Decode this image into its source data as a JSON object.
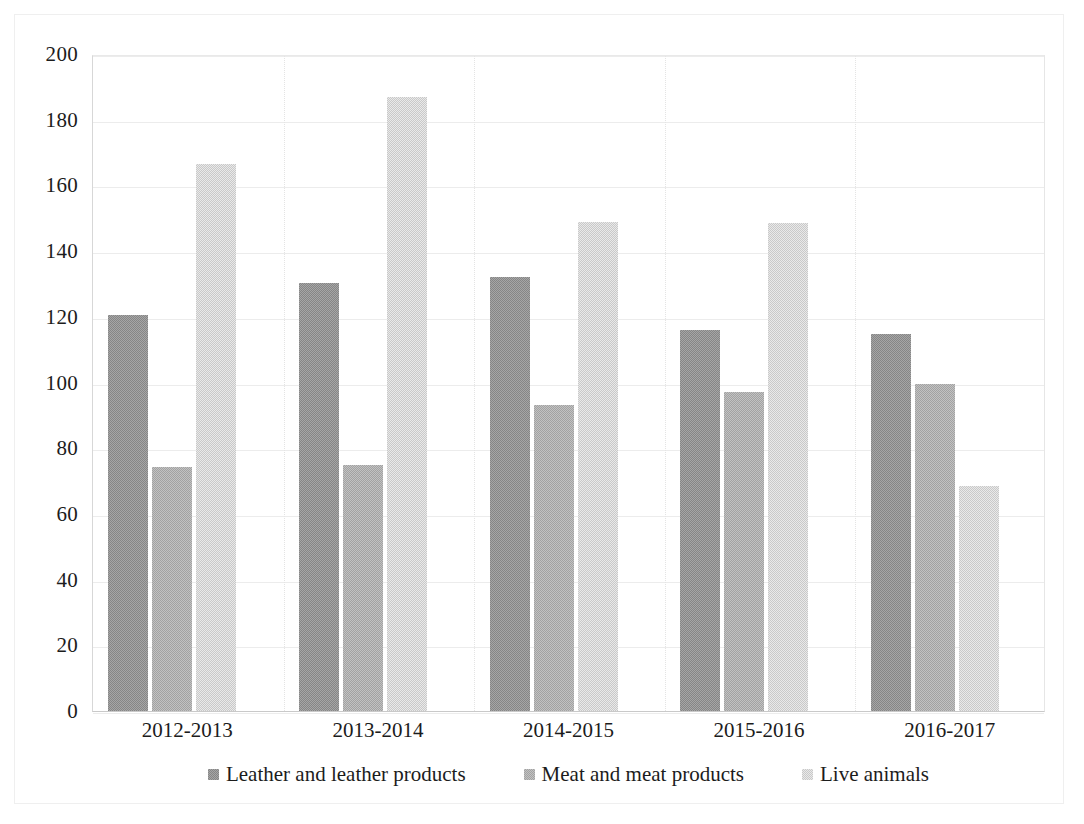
{
  "chart_data": {
    "type": "bar",
    "title": "",
    "subtitle": "",
    "xlabel": "",
    "ylabel": "",
    "categories": [
      "2012-2013",
      "2013-2014",
      "2014-2015",
      "2015-2016",
      "2016-2017"
    ],
    "series": [
      {
        "name": "Leather and leather products",
        "color": "#969696",
        "values": [
          120.5,
          130.3,
          132.0,
          116.0,
          114.8
        ]
      },
      {
        "name": "Meat and meat products",
        "color": "#b2b2b2",
        "values": [
          74.2,
          74.8,
          93.2,
          97.2,
          99.6
        ]
      },
      {
        "name": "Live animals",
        "color": "#d9d9d9",
        "values": [
          166.5,
          187.0,
          148.8,
          148.5,
          68.5
        ]
      }
    ],
    "ylim": [
      0,
      200
    ],
    "yticks": [
      0,
      20,
      40,
      60,
      80,
      100,
      120,
      140,
      160,
      180,
      200
    ],
    "ytick_labels": [
      "0",
      "20",
      "40",
      "60",
      "80",
      "100",
      "120",
      "140",
      "160",
      "180",
      "200"
    ],
    "grid": "horizontal-and-vertical",
    "legend_position": "bottom",
    "legend": [
      "Leather and leather products",
      "Meat and meat products",
      "Live animals"
    ],
    "annotations": []
  },
  "axis": {
    "y_tick_labels": [
      "200",
      "180",
      "160",
      "140",
      "120",
      "100",
      "80",
      "60",
      "40",
      "20",
      "0"
    ],
    "x_tick_labels": [
      "2012-2013",
      "2013-2014",
      "2014-2015",
      "2015-2016",
      "2016-2017"
    ]
  },
  "legend": {
    "items": [
      {
        "label": "Leather and leather products",
        "color": "#969696"
      },
      {
        "label": "Meat and meat products",
        "color": "#b2b2b2"
      },
      {
        "label": "Live animals",
        "color": "#d9d9d9"
      }
    ]
  }
}
